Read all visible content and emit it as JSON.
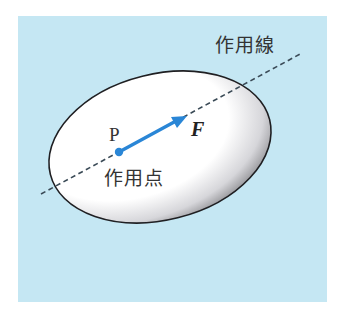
{
  "diagram": {
    "background_color": "#c5e7f3",
    "body_fill": "#ffffff",
    "body_shade": "#8a8a8e",
    "body_outline": "#1f1f22",
    "vector_color": "#2a86d6",
    "line_color": "#3a4a56",
    "labels": {
      "line_of_action": "作用線",
      "point_letter": "P",
      "force_letter": "F",
      "point_of_action": "作用点"
    }
  }
}
